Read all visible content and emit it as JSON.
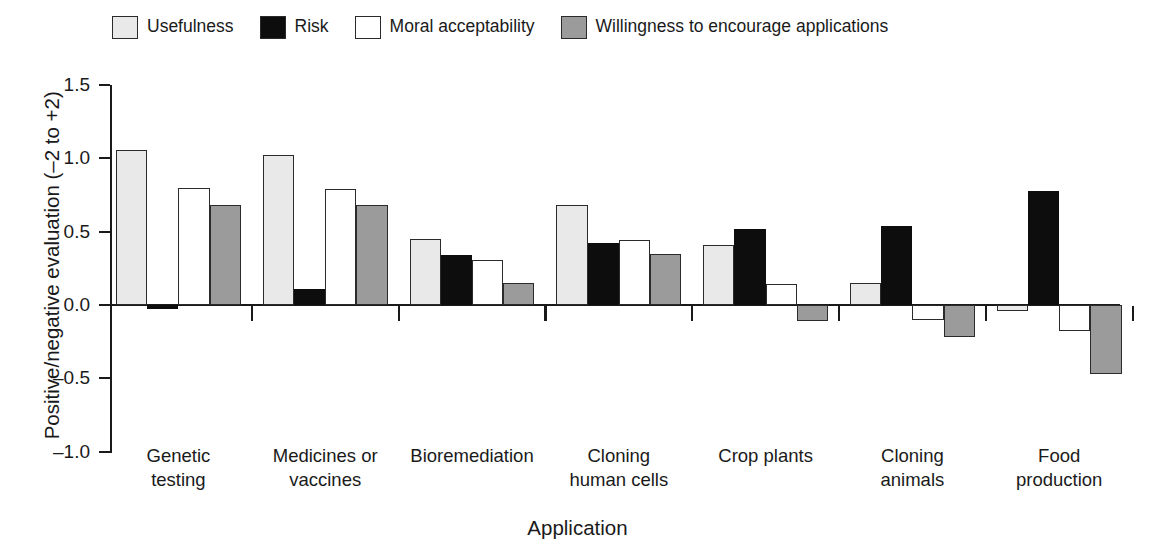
{
  "chart_data": {
    "type": "bar",
    "title": "",
    "xlabel": "Application",
    "ylabel": "Positive/negative evaluation (–2 to +2)",
    "ylim": [
      -1.0,
      1.5
    ],
    "yticks": [
      1.5,
      1.0,
      0.5,
      0.0,
      -0.5,
      -1.0
    ],
    "ytick_labels": [
      "1.5",
      "1.0",
      "0.5",
      "0.0",
      "-0.5",
      "-1.0"
    ],
    "grid": false,
    "legend_position": "top-left",
    "orientation": "vertical",
    "grouped": true,
    "zero_line": true,
    "categories": [
      "Genetic testing",
      "Medicines or vaccines",
      "Bioremediation",
      "Cloning human cells",
      "Crop plants",
      "Cloning animals",
      "Food production"
    ],
    "category_label_lines": [
      [
        "Genetic",
        "testing"
      ],
      [
        "Medicines or",
        "vaccines"
      ],
      [
        "Bioremediation"
      ],
      [
        "Cloning",
        "human cells"
      ],
      [
        "Crop plants"
      ],
      [
        "Cloning",
        "animals"
      ],
      [
        "Food",
        "production"
      ]
    ],
    "series": [
      {
        "name": "Usefulness",
        "color": "#e9e9e9",
        "edge_color": "#2b2b2b",
        "values": [
          1.06,
          1.02,
          0.45,
          0.68,
          0.41,
          0.15,
          -0.04
        ]
      },
      {
        "name": "Risk",
        "color": "#0d0d0d",
        "edge_color": "#0d0d0d",
        "values": [
          -0.03,
          0.11,
          0.34,
          0.42,
          0.52,
          0.54,
          0.78
        ]
      },
      {
        "name": "Moral acceptability",
        "color": "#ffffff",
        "edge_color": "#2b2b2b",
        "values": [
          0.8,
          0.79,
          0.31,
          0.44,
          0.14,
          -0.1,
          -0.18
        ]
      },
      {
        "name": "Willingness to encourage applications",
        "color": "#9b9b9b",
        "edge_color": "#2b2b2b",
        "values": [
          0.68,
          0.68,
          0.15,
          0.35,
          -0.11,
          -0.22,
          -0.47
        ]
      }
    ]
  },
  "legend": {
    "items": [
      {
        "label": "Usefulness",
        "swatch": "#e9e9e9"
      },
      {
        "label": "Risk",
        "swatch": "#0d0d0d"
      },
      {
        "label": "Moral acceptability",
        "swatch": "#ffffff"
      },
      {
        "label": "Willingness to encourage applications",
        "swatch": "#9b9b9b"
      }
    ]
  }
}
